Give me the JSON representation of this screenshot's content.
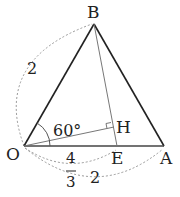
{
  "figure": {
    "points": {
      "O": "O",
      "A": "A",
      "B": "B",
      "E": "E",
      "H": "H"
    },
    "angle_label": "60°",
    "lengths": {
      "OB": "2",
      "OA": "2",
      "OE_numerator": "4",
      "OE_denominator": "3"
    },
    "colors": {
      "triangle": "#222222",
      "inner_lines": "#777777",
      "dashed_arcs": "#999999"
    }
  }
}
